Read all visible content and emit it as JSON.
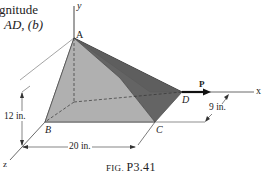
{
  "intro_text": {
    "line1": "gnitude",
    "line2": "AD, (b)"
  },
  "figure": {
    "caption_prefix": "FIG.",
    "caption_number": "P3.41",
    "points": {
      "A": "A",
      "B": "B",
      "C": "C",
      "D": "D"
    },
    "axes": {
      "x": "x",
      "y": "y",
      "z": "z"
    },
    "force_label": "P",
    "dimensions": {
      "height": "12 in.",
      "length": "20 in.",
      "depth": "9 in."
    },
    "colors": {
      "light_face": "#b4b4b4",
      "dark_face": "#5a5a5a",
      "mid_face": "#9a9a9a",
      "line": "#333333"
    }
  }
}
